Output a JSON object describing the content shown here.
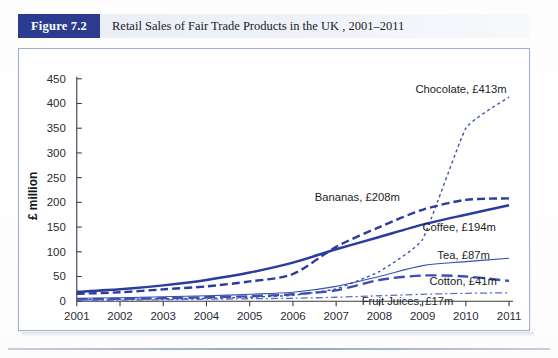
{
  "caption": {
    "figure_label": "Figure 7.2",
    "title": "Retail Sales of Fair Trade Products in the UK , 2001–2011"
  },
  "colors": {
    "badge": "#2b3b8f",
    "caption_bar": "#e9eef6",
    "frame_border": "#9fb0cc",
    "series_dark_blue": "#2b3b9e",
    "series_mid_blue": "#3b4fb0",
    "series_light_blue": "#5a6fc4",
    "axis": "#3a3a46"
  },
  "chart_data": {
    "type": "line",
    "title": "Retail Sales of Fair Trade Products in the UK , 2001–2011",
    "xlabel": "",
    "ylabel": "£ million",
    "x": [
      2001,
      2002,
      2003,
      2004,
      2005,
      2006,
      2007,
      2008,
      2009,
      2010,
      2011
    ],
    "xticklabels": [
      "2001",
      "2002",
      "2003",
      "2004",
      "2005",
      "2006",
      "2007",
      "2008",
      "2009",
      "2010",
      "2011"
    ],
    "yticks": [
      0,
      50,
      100,
      150,
      200,
      250,
      300,
      350,
      400,
      450
    ],
    "ylim": [
      0,
      450
    ],
    "xlim": [
      2001,
      2011
    ],
    "grid": false,
    "legend_position": "inline-annotations",
    "series": [
      {
        "name": "Chocolate",
        "end_label": "Chocolate, £413m",
        "end_value": 413,
        "style": "dotted",
        "color": "#3b4fb0",
        "values": [
          3,
          4,
          5,
          6,
          8,
          12,
          25,
          60,
          125,
          350,
          413
        ]
      },
      {
        "name": "Bananas",
        "end_label": "Bananas, £208m",
        "end_value": 208,
        "style": "dashed",
        "color": "#2b3b9e",
        "values": [
          15,
          18,
          24,
          30,
          40,
          55,
          110,
          150,
          185,
          205,
          208
        ]
      },
      {
        "name": "Coffee",
        "end_label": "Coffee, £194m",
        "end_value": 194,
        "style": "solid",
        "color": "#2b3b9e",
        "values": [
          19,
          24,
          32,
          43,
          58,
          78,
          105,
          130,
          155,
          175,
          194
        ]
      },
      {
        "name": "Tea",
        "end_label": "Tea, £87m",
        "end_value": 87,
        "style": "thin-solid",
        "color": "#3b4fb0",
        "values": [
          6,
          7,
          9,
          11,
          14,
          18,
          30,
          50,
          72,
          80,
          87
        ]
      },
      {
        "name": "Cotton",
        "end_label": "Cotton, £41m",
        "end_value": 41,
        "style": "long-dash",
        "color": "#3b4fb0",
        "values": [
          4,
          5,
          6,
          8,
          10,
          14,
          22,
          43,
          52,
          50,
          41
        ]
      },
      {
        "name": "Fruit Juices",
        "end_label": "Fruit Juices, £17m",
        "end_value": 17,
        "style": "dash-dot",
        "color": "#5a6fc4",
        "values": [
          2,
          2,
          3,
          4,
          5,
          6,
          8,
          11,
          14,
          16,
          17
        ]
      }
    ]
  }
}
